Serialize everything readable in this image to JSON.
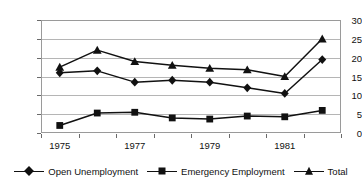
{
  "chart_data": {
    "type": "line",
    "title": "",
    "subtitle": "",
    "xlabel": "",
    "ylabel": "",
    "ylim": [
      0,
      30
    ],
    "ytick_values": [
      0,
      5,
      10,
      15,
      20,
      25,
      30
    ],
    "ytick_labels": [
      "0",
      "5",
      "10",
      "15",
      "20",
      "25",
      "30"
    ],
    "grid": true,
    "legend_position": "bottom",
    "x": [
      1975,
      1976,
      1977,
      1978,
      1979,
      1980,
      1981,
      1982
    ],
    "xtick_labels": [
      "1975",
      "1977",
      "1979",
      "1981"
    ],
    "xtick_label_positions": [
      1975,
      1977,
      1979,
      1981
    ],
    "categories": [
      "1975",
      "1976",
      "1977",
      "1978",
      "1979",
      "1980",
      "1981",
      "1982"
    ],
    "series": [
      {
        "name": "Open Unemployment",
        "marker": "diamond",
        "color": "#111111",
        "values": [
          16.0,
          16.5,
          13.5,
          14.0,
          13.5,
          12.0,
          10.5,
          19.5
        ]
      },
      {
        "name": "Emergency Employment",
        "marker": "square",
        "color": "#111111",
        "values": [
          2.0,
          5.3,
          5.5,
          4.0,
          3.7,
          4.5,
          4.3,
          6.0
        ]
      },
      {
        "name": "Total",
        "marker": "triangle",
        "color": "#111111",
        "values": [
          17.5,
          22.0,
          19.0,
          18.0,
          17.2,
          16.8,
          15.0,
          25.0
        ]
      }
    ]
  },
  "legend": {
    "entries": [
      {
        "label": "Open Unemployment",
        "marker": "diamond"
      },
      {
        "label": "Emergency Employment",
        "marker": "square"
      },
      {
        "label": "Total",
        "marker": "triangle"
      }
    ]
  },
  "colors": {
    "line": "#111111",
    "grid": "#b5b5b5",
    "frame": "#9a9a9a",
    "text": "#111111",
    "background": "#ffffff"
  }
}
